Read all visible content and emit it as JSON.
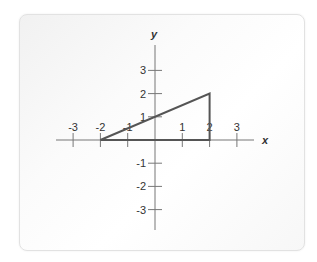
{
  "diagram": {
    "type": "coordinate-plane",
    "axes": {
      "x_label": "x",
      "y_label": "y",
      "x_ticks": [
        -3,
        -2,
        -1,
        1,
        2,
        3
      ],
      "y_ticks": [
        3,
        2,
        1,
        -1,
        -2,
        -3
      ],
      "x_range": [
        -3.5,
        4
      ],
      "y_range": [
        -3.8,
        4.2
      ]
    },
    "shape": {
      "name": "right triangle",
      "vertices": [
        [
          -2,
          0
        ],
        [
          2,
          0
        ],
        [
          2,
          2
        ]
      ],
      "stroke_color": "#555555"
    },
    "colors": {
      "axis": "#777777",
      "shape": "#555555",
      "text": "#333333"
    }
  }
}
